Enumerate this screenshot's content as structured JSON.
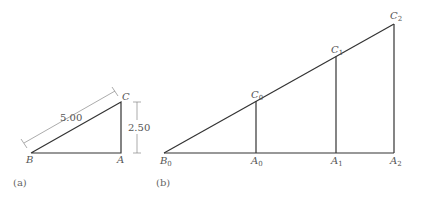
{
  "figure_a": {
    "caption": "(a)",
    "points": {
      "B": {
        "label": "B",
        "x": 31,
        "y": 153
      },
      "A": {
        "label": "A",
        "x": 121,
        "y": 153
      },
      "C": {
        "label": "C",
        "x": 121,
        "y": 102
      }
    },
    "dimensions": {
      "hypotenuse": "5.00",
      "height": "2.50"
    }
  },
  "figure_b": {
    "caption": "(b)",
    "labels": {
      "B0": {
        "main": "B",
        "sub": "0"
      },
      "A0": {
        "main": "A",
        "sub": "0"
      },
      "A1": {
        "main": "A",
        "sub": "1"
      },
      "A2": {
        "main": "A",
        "sub": "2"
      },
      "C0": {
        "main": "C",
        "sub": "0"
      },
      "C1": {
        "main": "C",
        "sub": "1"
      },
      "C2": {
        "main": "C",
        "sub": "2"
      }
    }
  },
  "colors": {
    "line": "#333333",
    "dimension_line": "#888888",
    "text": "#555555"
  }
}
